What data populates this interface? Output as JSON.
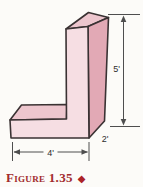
{
  "canvas": {
    "width": 143,
    "height": 187,
    "background": "#FCFBF8"
  },
  "figure": {
    "type": "3d-solid-diagram",
    "solid": {
      "description": "L-shaped rectangular solid (pink block)"
    },
    "dimensions": {
      "height": {
        "label": "5'"
      },
      "width": {
        "label": "4'"
      },
      "depth": {
        "label": "2'"
      }
    },
    "colors": {
      "front_face": "#F6DEE3",
      "top_face": "#EDC6CE",
      "side_face": "#E2A9B5",
      "outline": "#3A3233",
      "dimension_line": "#4E4E4E",
      "caption_red": "#A22C2E"
    },
    "caption": {
      "label": "Figure 1.35",
      "marker": "◆"
    }
  }
}
